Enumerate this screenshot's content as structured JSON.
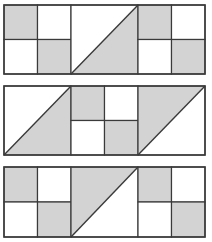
{
  "colors": {
    "shade": "#d3d3d3",
    "background": "#ffffff",
    "stroke": "#3a3a3a"
  },
  "figure": {
    "rows": [
      {
        "id": "row-1",
        "panels": [
          {
            "type": "checker",
            "shaded": [
              "top-left",
              "bottom-right"
            ]
          },
          {
            "type": "diagonal",
            "line": "bottom-left-to-top-right",
            "shaded": "bottom-right"
          },
          {
            "type": "checker",
            "shaded": [
              "top-left",
              "bottom-right"
            ]
          }
        ]
      },
      {
        "id": "row-2",
        "panels": [
          {
            "type": "diagonal",
            "line": "bottom-left-to-top-right",
            "shaded": "bottom-right"
          },
          {
            "type": "checker",
            "shaded": [
              "top-left",
              "bottom-right"
            ]
          },
          {
            "type": "diagonal",
            "line": "bottom-left-to-top-right",
            "shaded": "top-left"
          }
        ]
      },
      {
        "id": "row-3",
        "panels": [
          {
            "type": "checker",
            "shaded": [
              "top-left",
              "bottom-right"
            ]
          },
          {
            "type": "diagonal",
            "line": "bottom-left-to-top-right",
            "shaded": "top-left"
          },
          {
            "type": "checker",
            "shaded": [
              "top-left",
              "bottom-right"
            ]
          }
        ]
      }
    ]
  }
}
